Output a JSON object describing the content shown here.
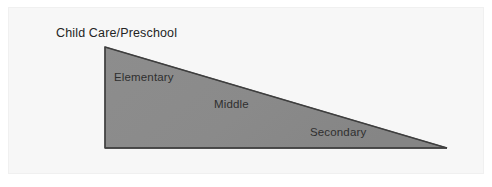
{
  "figure": {
    "title_label": "Child Care/Preschool",
    "shape": "right-triangle-wedge",
    "colors": {
      "background": "#ffffff",
      "panel": "#f7f7f7",
      "wedge_fill": "#8a8a8a",
      "wedge_stroke": "#4a4a4a",
      "text": "#2b2b2b"
    },
    "segments": [
      {
        "id": "elementary",
        "label": "Elementary"
      },
      {
        "id": "middle",
        "label": "Middle"
      },
      {
        "id": "secondary",
        "label": "Secondary"
      }
    ],
    "geometry": {
      "apex_top_left": "105,47",
      "bottom_left": "105,148",
      "bottom_right_tip": "447,148"
    }
  }
}
